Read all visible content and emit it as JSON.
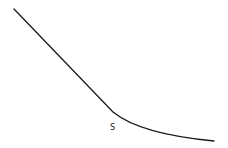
{
  "diagram": {
    "type": "curve-sketch",
    "stroke_color": "#1a1a1a",
    "background": "#ffffff",
    "curve": {
      "description": "Straight descending line that bends at a knee point into a flattening curve",
      "start": [
        14,
        9
      ],
      "knee": [
        113,
        112
      ],
      "end": [
        214,
        141
      ]
    },
    "point_label": {
      "text": "S",
      "position": [
        110,
        124
      ]
    }
  }
}
